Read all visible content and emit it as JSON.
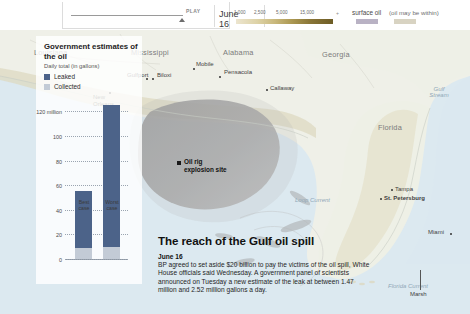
{
  "topbar": {
    "play_label": "PLAY",
    "date_label": "June 16",
    "gradient_ticks": [
      "1,000",
      "2,500",
      "5,000",
      "15,000"
    ],
    "gradient_min_mark": "–",
    "gradient_max_mark": "+",
    "surface_oil_label": "surface oil",
    "within_label": "(oil may be within)",
    "colors": {
      "gradient_light": "#ece5cf",
      "gradient_dark": "#6d5c26",
      "surface_oil": "#b9b2c4",
      "within": "#d8d3c2"
    }
  },
  "chart_data": {
    "type": "bar",
    "title": "Government estimates of the oil",
    "subtitle": "Daily total (in gallons)",
    "xlabel": "",
    "ylabel": "",
    "categories": [
      "Best case",
      "Worst case"
    ],
    "series": [
      {
        "name": "Leaked",
        "color": "#4c6389",
        "values": [
          55,
          125
        ]
      },
      {
        "name": "Collected",
        "color": "#c3cbd6",
        "values": [
          9,
          10
        ]
      }
    ],
    "stacked": true,
    "ylim": [
      0,
      130
    ],
    "yticks": [
      0,
      20,
      40,
      60,
      80,
      100,
      120
    ],
    "ytick_labels": [
      "0",
      "20",
      "40",
      "60",
      "80",
      "100",
      "120 million"
    ],
    "grid": true,
    "legend_position": "top-left"
  },
  "map": {
    "states": [
      {
        "name": "Louisiana",
        "x": 34,
        "y": 18
      },
      {
        "name": "Mississippi",
        "x": 131,
        "y": 18
      },
      {
        "name": "Alabama",
        "x": 223,
        "y": 18
      },
      {
        "name": "Georgia",
        "x": 322,
        "y": 20
      },
      {
        "name": "Florida",
        "x": 378,
        "y": 93
      }
    ],
    "cities": [
      {
        "name": "Gulfport",
        "x": 135,
        "y": 40
      },
      {
        "name": "Biloxi",
        "x": 166,
        "y": 40
      },
      {
        "name": "Mobile",
        "x": 196,
        "y": 30
      },
      {
        "name": "Pensacola",
        "x": 224,
        "y": 38
      },
      {
        "name": "Callaway",
        "x": 270,
        "y": 57
      },
      {
        "name": "New Orleans",
        "x": 99,
        "y": 64
      },
      {
        "name": "Tampa",
        "x": 395,
        "y": 157
      },
      {
        "name": "St. Petersburg",
        "x": 384,
        "y": 166
      },
      {
        "name": "Miami",
        "x": 434,
        "y": 201
      }
    ],
    "water_labels": [
      {
        "name": "Gulf Stream",
        "x": 428,
        "y": 60
      },
      {
        "name": "Loop Current",
        "x": 295,
        "y": 167
      },
      {
        "name": "Florida Current",
        "x": 391,
        "y": 255
      }
    ],
    "marsh_label": "Marsh",
    "annotation": {
      "line1": "Oil rig",
      "line2": "explosion site"
    }
  },
  "story": {
    "headline": "The reach of the Gulf oil spill",
    "date": "June 16",
    "body": "BP agreed to set aside $20 billion to pay the victims of the oil spill, White House officials said Wednesday. A government panel of scientists announced on Tuesday a new estimate of the leak at between 1.47 million and 2.52 million gallons a day."
  }
}
